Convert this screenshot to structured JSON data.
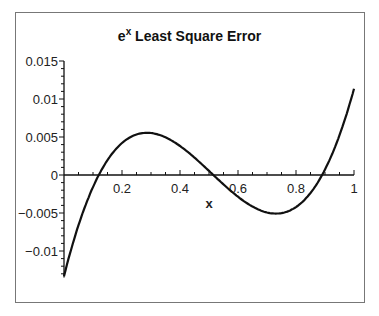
{
  "chart_data": {
    "type": "line",
    "title_base": "e",
    "title_sup": "x",
    "title_rest": " Least Square Error",
    "xlabel": "x",
    "ylabel": "",
    "xlim": [
      0,
      1
    ],
    "ylim": [
      -0.0135,
      0.015
    ],
    "x_ticks": [
      "0.2",
      "0.4",
      "0.6",
      "0.8",
      "1"
    ],
    "y_ticks": [
      "0.015",
      "0.01",
      "0.005",
      "0",
      "−0.005",
      "−0.01"
    ],
    "grid": false,
    "legend": null,
    "series": [
      {
        "name": "error",
        "x": [
          0,
          0.05,
          0.1,
          0.12,
          0.15,
          0.2,
          0.25,
          0.29,
          0.35,
          0.4,
          0.45,
          0.5,
          0.52,
          0.55,
          0.6,
          0.65,
          0.7,
          0.74,
          0.8,
          0.85,
          0.89,
          0.95,
          1.0
        ],
        "values": [
          -0.0133,
          -0.0068,
          -0.0018,
          0.0,
          0.0023,
          0.0048,
          0.0059,
          0.006,
          0.0055,
          0.0042,
          0.0025,
          0.0007,
          0.0,
          -0.0012,
          -0.0036,
          -0.0055,
          -0.0064,
          -0.0065,
          -0.0055,
          -0.0028,
          0.0,
          0.0065,
          0.0145
        ]
      }
    ]
  }
}
